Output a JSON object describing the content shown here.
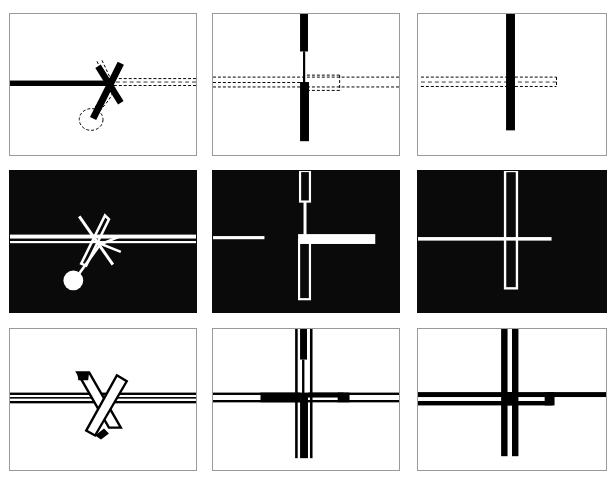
{
  "figure": {
    "title": "Scissors cutting a line — nine rendering variants",
    "width": 616,
    "height": 487,
    "background_color": "#ffffff",
    "grid": {
      "rows": 3,
      "columns": 3
    },
    "colors": {
      "paper": "#ffffff",
      "ink": "#000000",
      "panel_border": "#9a9a9a",
      "inverted_background": "#0a0a0a",
      "inverted_ink": "#ffffff"
    }
  },
  "panels": [
    {
      "id": "panel-1",
      "row": 1,
      "column": 1,
      "position": "top-left",
      "style": "outline-on-white",
      "label": "Solid scissor cross with dashed construction outline",
      "background": "#ffffff",
      "ink": "#000000",
      "elements": [
        "thick-horizontal-bar-left",
        "dashed-horizontal-band-right",
        "solid-x-blades",
        "dashed-scissor-handle-loop"
      ]
    },
    {
      "id": "panel-2",
      "row": 1,
      "column": 2,
      "position": "top-center",
      "style": "outline-on-white",
      "label": "Vertical blade with dashed horizontal band",
      "background": "#ffffff",
      "ink": "#000000",
      "elements": [
        "thick-vertical-bar-top",
        "thin-vertical-line",
        "thick-vertical-bar-bottom",
        "dashed-horizontal-band"
      ]
    },
    {
      "id": "panel-3",
      "row": 1,
      "column": 3,
      "position": "top-right",
      "style": "outline-on-white",
      "label": "Single vertical bar crossing dashed horizontal band",
      "background": "#ffffff",
      "ink": "#000000",
      "elements": [
        "thick-vertical-bar",
        "dashed-horizontal-band"
      ]
    },
    {
      "id": "panel-4",
      "row": 2,
      "column": 1,
      "position": "middle-left",
      "style": "inverted",
      "label": "Inverted scissors over white horizontal band",
      "background": "#0a0a0a",
      "ink": "#ffffff",
      "elements": [
        "white-horizontal-band",
        "white-thin-rule",
        "white-x-blades",
        "white-handle-circle"
      ]
    },
    {
      "id": "panel-5",
      "row": 2,
      "column": 2,
      "position": "middle-center",
      "style": "inverted",
      "label": "Inverted vertical blade outline with white cross band",
      "background": "#0a0a0a",
      "ink": "#ffffff",
      "elements": [
        "white-outline-blade-top",
        "white-thin-vertical-line",
        "white-outline-blade-bottom",
        "white-horizontal-band",
        "white-thin-rule-left"
      ]
    },
    {
      "id": "panel-6",
      "row": 2,
      "column": 3,
      "position": "middle-right",
      "style": "inverted",
      "label": "Inverted vertical outline bar with white horizontal rule",
      "background": "#0a0a0a",
      "ink": "#ffffff",
      "elements": [
        "white-outline-vertical-bar",
        "white-horizontal-rule"
      ]
    },
    {
      "id": "panel-7",
      "row": 3,
      "column": 1,
      "position": "bottom-left",
      "style": "line-art-on-white",
      "label": "Line-art scissors crossing a double horizontal rule",
      "background": "#ffffff",
      "ink": "#000000",
      "elements": [
        "double-horizontal-rule",
        "outlined-x-blades"
      ]
    },
    {
      "id": "panel-8",
      "row": 3,
      "column": 2,
      "position": "bottom-center",
      "style": "line-art-on-white",
      "label": "Line-art vertical blade and horizontal rules",
      "background": "#ffffff",
      "ink": "#000000",
      "elements": [
        "vertical-double-rule",
        "solid-vertical-blade",
        "horizontal-double-rule",
        "horizontal-stub-right"
      ]
    },
    {
      "id": "panel-9",
      "row": 3,
      "column": 3,
      "position": "bottom-right",
      "style": "line-art-on-white",
      "label": "Line-art crossing bars",
      "background": "#ffffff",
      "ink": "#000000",
      "elements": [
        "vertical-double-rule",
        "horizontal-double-rule",
        "horizontal-stub-right"
      ]
    }
  ],
  "geometry": {
    "panel_boxes": [
      {
        "x": 9,
        "y": 13,
        "w": 188,
        "h": 143
      },
      {
        "x": 212,
        "y": 13,
        "w": 188,
        "h": 143
      },
      {
        "x": 417,
        "y": 13,
        "w": 190,
        "h": 143
      },
      {
        "x": 9,
        "y": 170,
        "w": 188,
        "h": 143
      },
      {
        "x": 212,
        "y": 170,
        "w": 188,
        "h": 143
      },
      {
        "x": 417,
        "y": 170,
        "w": 190,
        "h": 143
      },
      {
        "x": 9,
        "y": 328,
        "w": 188,
        "h": 143
      },
      {
        "x": 212,
        "y": 328,
        "w": 188,
        "h": 143
      },
      {
        "x": 417,
        "y": 328,
        "w": 190,
        "h": 143
      }
    ]
  }
}
